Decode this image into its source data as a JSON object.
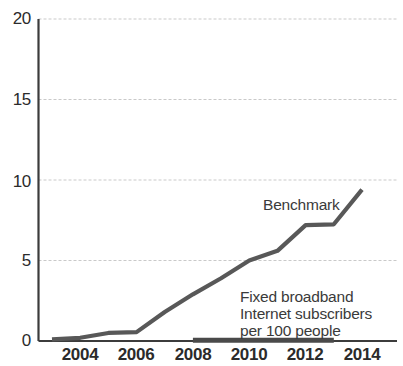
{
  "chart_data": {
    "type": "line",
    "title": "",
    "subtitle": "",
    "xlabel": "",
    "ylabel": "",
    "xlim": [
      2003,
      2014
    ],
    "ylim": [
      0,
      20
    ],
    "grid": true,
    "grid_axis": "y",
    "legend": "none",
    "legend_position": "inline-annotations",
    "x": [
      2003,
      2004,
      2005,
      2006,
      2007,
      2008,
      2009,
      2010,
      2011,
      2012,
      2013,
      2014
    ],
    "xticks": [
      "2004",
      "2006",
      "2008",
      "2010",
      "2012",
      "2014"
    ],
    "xtick_values": [
      2004,
      2006,
      2008,
      2010,
      2012,
      2014
    ],
    "yticks": [
      "0",
      "5",
      "10",
      "15",
      "20"
    ],
    "ytick_values": [
      0,
      5,
      10,
      15,
      20
    ],
    "series": [
      {
        "name": "Benchmark",
        "color": "#585858",
        "values": [
          0.1,
          0.2,
          0.5,
          0.55,
          1.8,
          2.9,
          3.9,
          5.0,
          5.6,
          7.2,
          7.25,
          9.4
        ]
      },
      {
        "name": "Fixed broadband Internet subscribers per 100 people",
        "color": "#4a4a4a",
        "x": [
          2008,
          2009,
          2010,
          2011,
          2012,
          2013
        ],
        "values": [
          0.05,
          0.05,
          0.05,
          0.05,
          0.05,
          0.05
        ]
      }
    ],
    "annotations": [
      {
        "name": "benchmark-label",
        "text": "Benchmark",
        "lines": [
          "Benchmark"
        ],
        "x": 2011.0,
        "y": 8.2
      },
      {
        "name": "series-label",
        "text": "Fixed broadband Internet subscribers per 100 people",
        "lines": [
          "Fixed broadband",
          "Internet subscribers",
          "per 100 people"
        ],
        "x": 2010.0,
        "y": 3.0
      }
    ]
  },
  "axes": {
    "y_tick_labels": [
      "20",
      "15",
      "10",
      "5",
      "0"
    ],
    "x_tick_labels": [
      "2004",
      "2006",
      "2008",
      "2010",
      "2012",
      "2014"
    ]
  },
  "annotations": {
    "benchmark": "Benchmark",
    "series_line1": "Fixed broadband",
    "series_line2": "Internet subscribers",
    "series_line3": "per 100 people"
  },
  "colors": {
    "line": "#585858",
    "axis": "#3c3c3c",
    "grid": "#c9c9c9",
    "text": "#2b2b2b",
    "background": "#ffffff"
  }
}
